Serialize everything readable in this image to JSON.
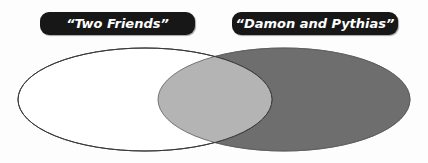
{
  "diagram": {
    "type": "venn",
    "title": "",
    "background_color": "#fdfdfd",
    "labels": {
      "left": "“Two Friends”",
      "right": "“Damon and Pythias”"
    },
    "label_style": {
      "background_color": "#171717",
      "text_color": "#ffffff"
    },
    "sets": [
      {
        "name": "left-set",
        "label": "“Two Friends”",
        "fill_color": "#ffffff",
        "stroke_color": "#3a3a3a",
        "cx": 145,
        "cy": 99.5,
        "rx": 127,
        "ry": 51.5
      },
      {
        "name": "right-set",
        "label": "“Damon and Pythias”",
        "fill_color": "#6e6e6e",
        "stroke_color": "#5a5a5a",
        "cx": 284,
        "cy": 99.5,
        "rx": 126,
        "ry": 51.5
      }
    ],
    "overlap": {
      "name": "intersection",
      "fill_color": "#b4b4b4",
      "content": ""
    }
  }
}
